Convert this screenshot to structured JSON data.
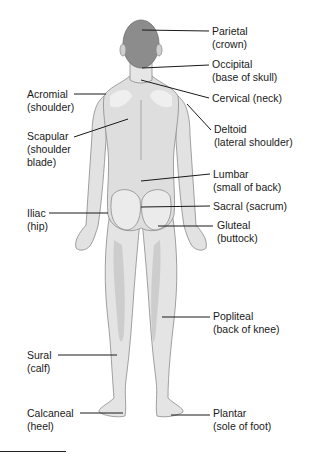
{
  "diagram": {
    "colors": {
      "background": "#ffffff",
      "skin_light": "#ececec",
      "skin_mid": "#d6d6d6",
      "skin_shadow": "#c4c4c4",
      "hair": "#8c8c8c",
      "outline": "#8a8a8a",
      "leader_line": "#1a1a1a",
      "text": "#1a1a1a"
    },
    "labels": [
      {
        "id": "parietal",
        "term": "Parietal",
        "desc": "(crown)",
        "side": "right",
        "x": 212,
        "y": 25,
        "point": [
          142,
          30
        ],
        "line_start": [
          209,
          31
        ]
      },
      {
        "id": "occipital",
        "term": "Occipital",
        "desc": "(base of skull)",
        "side": "right",
        "x": 212,
        "y": 60,
        "point": [
          142,
          68
        ],
        "line_start": [
          209,
          65
        ]
      },
      {
        "id": "cervical",
        "term": "Cervical",
        "desc": "(neck)",
        "side": "right",
        "x": 212,
        "y": 93,
        "point": [
          141,
          80
        ],
        "line_start": [
          209,
          98
        ],
        "inline": true
      },
      {
        "id": "deltoid",
        "term": "Deltoid",
        "desc": "(lateral shoulder)",
        "side": "right",
        "x": 214,
        "y": 123,
        "point": [
          187,
          104
        ],
        "line_start": [
          211,
          130
        ]
      },
      {
        "id": "lumbar",
        "term": "Lumbar",
        "desc": "(small of back)",
        "side": "right",
        "x": 213,
        "y": 168,
        "point": [
          141,
          181
        ],
        "line_start": [
          210,
          174
        ]
      },
      {
        "id": "sacral",
        "term": "Sacral",
        "desc": "(sacrum)",
        "side": "right",
        "x": 213,
        "y": 200,
        "point": [
          141,
          207
        ],
        "line_start": [
          210,
          206
        ],
        "inline": true
      },
      {
        "id": "gluteal",
        "term": "Gluteal",
        "desc": "(buttock)",
        "side": "right",
        "x": 217,
        "y": 220,
        "point": [
          158,
          226
        ],
        "line_start": [
          213,
          226
        ]
      },
      {
        "id": "popliteal",
        "term": "Popliteal",
        "desc": "(back of knee)",
        "side": "right",
        "x": 213,
        "y": 310,
        "point": [
          162,
          317
        ],
        "line_start": [
          210,
          317
        ]
      },
      {
        "id": "plantar",
        "term": "Plantar",
        "desc": "(sole of foot)",
        "side": "right",
        "x": 213,
        "y": 407,
        "point": [
          171,
          415
        ],
        "line_start": [
          210,
          415
        ]
      },
      {
        "id": "acromial",
        "term": "Acromial",
        "desc": "(shoulder)",
        "side": "left",
        "x": 27,
        "y": 88,
        "point": [
          106,
          94
        ],
        "line_start": [
          74,
          94
        ]
      },
      {
        "id": "scapular",
        "term": "Scapular",
        "desc": "(shoulder blade)",
        "desc_lines": [
          "(shoulder",
          "blade)"
        ],
        "side": "left",
        "x": 27,
        "y": 131,
        "point": [
          128,
          119
        ],
        "line_start": [
          74,
          137
        ]
      },
      {
        "id": "iliac",
        "term": "Iliac",
        "desc": "(hip)",
        "side": "left",
        "x": 27,
        "y": 208,
        "point": [
          108,
          213
        ],
        "line_start": [
          49,
          213
        ]
      },
      {
        "id": "sural",
        "term": "Sural",
        "desc": "(calf)",
        "side": "left",
        "x": 27,
        "y": 349,
        "point": [
          117,
          355
        ],
        "line_start": [
          58,
          355
        ]
      },
      {
        "id": "calcaneal",
        "term": "Calcaneal",
        "desc": "(heel)",
        "side": "left",
        "x": 27,
        "y": 407,
        "point": [
          123,
          413
        ],
        "line_start": [
          80,
          413
        ]
      }
    ]
  }
}
